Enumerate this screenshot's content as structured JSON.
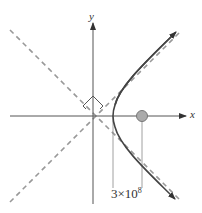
{
  "diagram": {
    "axis_labels": {
      "x": "x",
      "y": "y"
    },
    "vertex_label": "3×10",
    "vertex_label_exp": "8",
    "colors": {
      "axis": "#444444",
      "asymptote": "#999999",
      "curve": "#444444",
      "point_fill": "#aaaaaa",
      "guide": "#888888"
    }
  }
}
